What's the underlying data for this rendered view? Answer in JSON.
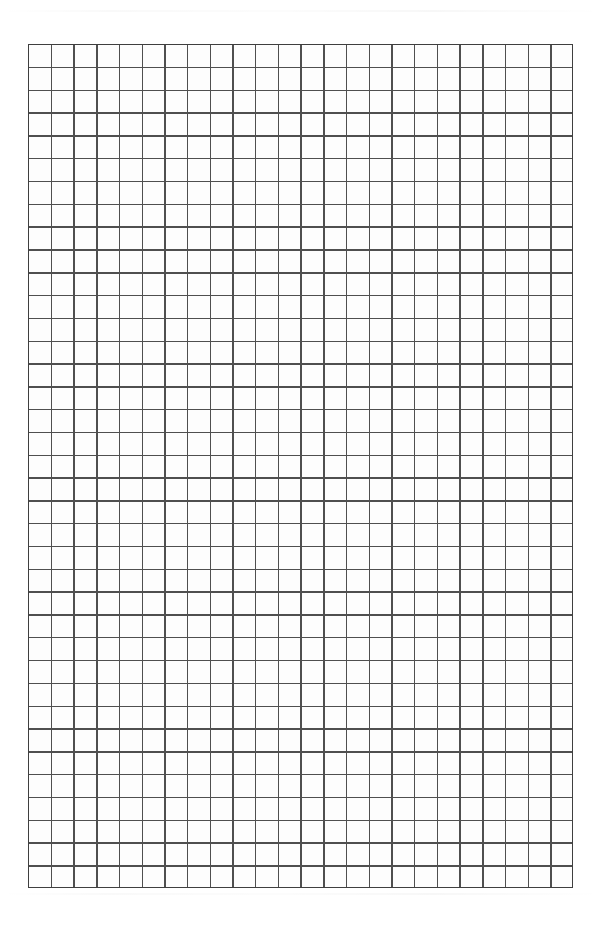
{
  "document": {
    "kind": "grid-paper",
    "title": "Blank Grid Paper Sheet",
    "description": "Scanned blank square-ruled graph paper page with no writing or markings.",
    "page_width_px": 603,
    "page_height_px": 936,
    "background_color": "#ffffff",
    "content_text": ""
  },
  "grid": {
    "columns": 24,
    "rows": 37,
    "cell_width_px": 22.7,
    "cell_height_px": 22.81,
    "left_px": 28,
    "top_px": 44,
    "width_px": 545,
    "height_px": 844,
    "line_color": "#4f4f4f",
    "line_width_px": 1.4,
    "border_color": "#3f3f3f",
    "border_width_px": 1.8,
    "cell_fill_color": "#fdfdfd",
    "label": "Square ruled grid"
  },
  "margins": {
    "top_px": 44,
    "bottom_px": 48,
    "left_px": 28,
    "right_px": 30,
    "label": "Blank page margin"
  },
  "annotations": {
    "artifact_label": "Scanner edge artifact"
  }
}
